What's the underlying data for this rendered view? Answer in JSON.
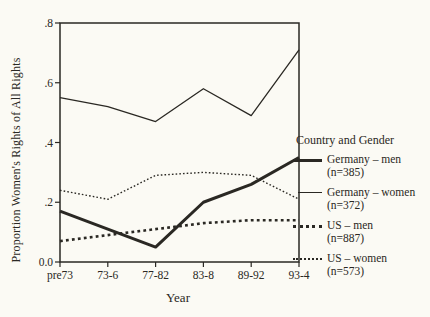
{
  "figure": {
    "y_axis_title": "Proportion Women's Rights of All Rights",
    "x_axis_title": "Year"
  },
  "legend": {
    "title": "Country and Gender",
    "items": [
      {
        "label": "Germany – men",
        "n": "(n=385)",
        "style": "thick-solid"
      },
      {
        "label": "Germany – women",
        "n": "(n=372)",
        "style": "thin-solid"
      },
      {
        "label": "US – men",
        "n": "(n=887)",
        "style": "thick-dotted"
      },
      {
        "label": "US – women",
        "n": "(n=573)",
        "style": "fine-dotted"
      }
    ]
  },
  "chart_data": {
    "type": "line",
    "title": "",
    "xlabel": "Year",
    "ylabel": "Proportion Women's Rights of All Rights",
    "categories": [
      "pre73",
      "73-6",
      "77-82",
      "83-8",
      "89-92",
      "93-4"
    ],
    "series": [
      {
        "name": "Germany – men",
        "n": 385,
        "style": "thick-solid",
        "values": [
          0.17,
          0.11,
          0.05,
          0.2,
          0.26,
          0.35
        ]
      },
      {
        "name": "Germany – women",
        "n": 372,
        "style": "thin-solid",
        "values": [
          0.55,
          0.52,
          0.47,
          0.58,
          0.49,
          0.71
        ]
      },
      {
        "name": "US – men",
        "n": 887,
        "style": "thick-dotted",
        "values": [
          0.07,
          0.09,
          0.11,
          0.13,
          0.14,
          0.14
        ]
      },
      {
        "name": "US – women",
        "n": 573,
        "style": "fine-dotted",
        "values": [
          0.24,
          0.21,
          0.29,
          0.3,
          0.29,
          0.21
        ]
      }
    ],
    "y_ticks": [
      {
        "value": 0.8,
        "label": ".8"
      },
      {
        "value": 0.6,
        "label": ".6"
      },
      {
        "value": 0.4,
        "label": ".4"
      },
      {
        "value": 0.2,
        "label": ".2"
      },
      {
        "value": 0.0,
        "label": "0.0"
      }
    ],
    "ylim": [
      0.0,
      0.8
    ],
    "grid": false,
    "frame": "box",
    "legend_position": "right"
  },
  "colors": {
    "ink": "#2a2823",
    "paper": "#fbfaf4"
  }
}
